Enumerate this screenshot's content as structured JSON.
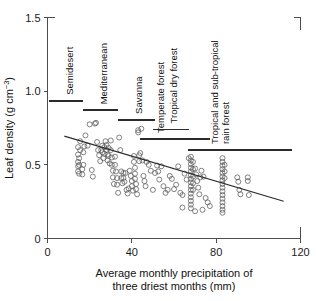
{
  "chart_data": {
    "type": "scatter",
    "title": "",
    "xlabel": "Average monthly precipitation of three driest months (mm)",
    "xlabel_line1": "Average monthly precipitation of",
    "xlabel_line2": "three driest months (mm)",
    "ylabel": "Leaf density (g cm-3)",
    "ylabel_main": "Leaf density (g cm",
    "ylabel_sup": "−3",
    "ylabel_close": ")",
    "xlim": [
      0,
      120
    ],
    "ylim": [
      0,
      1.5
    ],
    "xticks": [
      0,
      40,
      80,
      120
    ],
    "xticklabels": [
      "0",
      "40",
      "80",
      "120"
    ],
    "yticks": [
      0,
      0.5,
      1.0,
      1.5
    ],
    "yticklabels": [
      "0",
      "0.5",
      "1.0",
      "1.5"
    ],
    "grid": false,
    "legend": "none",
    "marker": "open-circle",
    "trendline": {
      "label": "regression line",
      "x_start": 8,
      "y_start": 0.695,
      "x_end": 112,
      "y_end": 0.253
    },
    "habitat_ranges": [
      {
        "label": "Semidesert",
        "x_start": 0.5,
        "y": 0.935,
        "x_end": 17.0
      },
      {
        "label": "Mediterranean",
        "x_start": 17.0,
        "y": 0.87,
        "x_end": 33.5
      },
      {
        "label": "Savanna",
        "x_start": 33.5,
        "y": 0.805,
        "x_end": 51.0
      },
      {
        "label": "Tropical dry forest",
        "x_start": 50.0,
        "y": 0.74,
        "x_end": 67.0
      },
      {
        "label": "Temperate forest",
        "x_start": 44.0,
        "y": 0.675,
        "x_end": 77.0
      },
      {
        "label": "Tropical and sub-tropical rain forest",
        "x_start": 66.5,
        "y": 0.6,
        "x_end": 116.0
      }
    ],
    "points": [
      [
        14.5,
        0.62
      ],
      [
        14.5,
        0.57
      ],
      [
        14.5,
        0.52
      ],
      [
        14.5,
        0.49
      ],
      [
        14.5,
        0.455
      ],
      [
        15.5,
        0.66
      ],
      [
        15.5,
        0.6
      ],
      [
        15.0,
        0.545
      ],
      [
        15.0,
        0.5
      ],
      [
        15.0,
        0.44
      ],
      [
        16.5,
        0.47
      ],
      [
        16.5,
        0.435
      ],
      [
        17.0,
        0.585
      ],
      [
        17.5,
        0.625
      ],
      [
        17.0,
        0.5
      ],
      [
        18.0,
        0.7
      ],
      [
        19.0,
        0.63
      ],
      [
        20.0,
        0.775
      ],
      [
        21.0,
        0.465
      ],
      [
        21.5,
        0.42
      ],
      [
        22.5,
        0.78
      ],
      [
        23.0,
        0.785
      ],
      [
        23.5,
        0.655
      ],
      [
        24.0,
        0.6
      ],
      [
        24.5,
        0.565
      ],
      [
        25.0,
        0.525
      ],
      [
        25.5,
        0.6
      ],
      [
        26.0,
        0.63
      ],
      [
        26.0,
        0.585
      ],
      [
        26.5,
        0.545
      ],
      [
        27.0,
        0.62
      ],
      [
        27.0,
        0.575
      ],
      [
        27.5,
        0.66
      ],
      [
        28.0,
        0.635
      ],
      [
        28.0,
        0.6
      ],
      [
        28.5,
        0.57
      ],
      [
        28.5,
        0.53
      ],
      [
        29.0,
        0.615
      ],
      [
        29.0,
        0.56
      ],
      [
        29.5,
        0.51
      ],
      [
        30.0,
        0.665
      ],
      [
        30.0,
        0.6
      ],
      [
        30.5,
        0.55
      ],
      [
        30.5,
        0.5
      ],
      [
        31.0,
        0.46
      ],
      [
        31.0,
        0.415
      ],
      [
        31.5,
        0.37
      ],
      [
        32.0,
        0.555
      ],
      [
        32.0,
        0.5
      ],
      [
        32.5,
        0.455
      ],
      [
        33.0,
        0.41
      ],
      [
        33.0,
        0.365
      ],
      [
        33.5,
        0.31
      ],
      [
        34.0,
        0.685
      ],
      [
        34.5,
        0.6
      ],
      [
        35.0,
        0.455
      ],
      [
        35.0,
        0.41
      ],
      [
        35.5,
        0.375
      ],
      [
        36.0,
        0.445
      ],
      [
        36.0,
        0.41
      ],
      [
        36.5,
        0.385
      ],
      [
        37.0,
        0.445
      ],
      [
        37.5,
        0.33
      ],
      [
        38.0,
        0.305
      ],
      [
        38.5,
        0.34
      ],
      [
        39.0,
        0.46
      ],
      [
        39.5,
        0.425
      ],
      [
        40.0,
        0.39
      ],
      [
        40.0,
        0.355
      ],
      [
        40.5,
        0.325
      ],
      [
        41.0,
        0.56
      ],
      [
        41.0,
        0.52
      ],
      [
        41.5,
        0.48
      ],
      [
        41.5,
        0.44
      ],
      [
        41.5,
        0.405
      ],
      [
        42.0,
        0.37
      ],
      [
        42.0,
        0.335
      ],
      [
        42.5,
        0.3
      ],
      [
        43.0,
        0.735
      ],
      [
        43.0,
        0.72
      ],
      [
        43.5,
        0.565
      ],
      [
        43.5,
        0.525
      ],
      [
        44.0,
        0.58
      ],
      [
        44.5,
        0.745
      ],
      [
        45.0,
        0.53
      ],
      [
        45.5,
        0.425
      ],
      [
        46.0,
        0.39
      ],
      [
        46.5,
        0.355
      ],
      [
        47.0,
        0.52
      ],
      [
        48.0,
        0.5
      ],
      [
        49.0,
        0.46
      ],
      [
        50.0,
        0.33
      ],
      [
        51.0,
        0.445
      ],
      [
        52.0,
        0.495
      ],
      [
        52.5,
        0.455
      ],
      [
        53.0,
        0.4
      ],
      [
        54.0,
        0.49
      ],
      [
        55.0,
        0.355
      ],
      [
        56.0,
        0.31
      ],
      [
        57.0,
        0.33
      ],
      [
        58.0,
        0.425
      ],
      [
        59.0,
        0.405
      ],
      [
        60.0,
        0.335
      ],
      [
        61.0,
        0.365
      ],
      [
        62.0,
        0.49
      ],
      [
        63.0,
        0.31
      ],
      [
        64.0,
        0.295
      ],
      [
        65.0,
        0.44
      ],
      [
        66.0,
        0.4
      ],
      [
        67.0,
        0.545
      ],
      [
        68.0,
        0.555
      ],
      [
        68.0,
        0.53
      ],
      [
        68.0,
        0.505
      ],
      [
        68.0,
        0.48
      ],
      [
        68.0,
        0.455
      ],
      [
        68.0,
        0.43
      ],
      [
        68.0,
        0.405
      ],
      [
        68.0,
        0.38
      ],
      [
        68.0,
        0.355
      ],
      [
        68.0,
        0.33
      ],
      [
        68.0,
        0.305
      ],
      [
        68.0,
        0.28
      ],
      [
        68.0,
        0.255
      ],
      [
        68.0,
        0.23
      ],
      [
        68.0,
        0.205
      ],
      [
        69.0,
        0.52
      ],
      [
        69.0,
        0.47
      ],
      [
        69.0,
        0.42
      ],
      [
        69.0,
        0.375
      ],
      [
        69.0,
        0.33
      ],
      [
        70.0,
        0.475
      ],
      [
        70.5,
        0.435
      ],
      [
        71.0,
        0.39
      ],
      [
        71.5,
        0.345
      ],
      [
        72.0,
        0.3
      ],
      [
        72.5,
        0.415
      ],
      [
        73.0,
        0.46
      ],
      [
        74.0,
        0.42
      ],
      [
        75.0,
        0.275
      ],
      [
        76.0,
        0.245
      ],
      [
        77.0,
        0.22
      ],
      [
        64.0,
        0.21
      ],
      [
        70.0,
        0.185
      ],
      [
        73.5,
        0.195
      ],
      [
        83.0,
        0.545
      ],
      [
        83.0,
        0.52
      ],
      [
        83.0,
        0.495
      ],
      [
        83.0,
        0.47
      ],
      [
        83.0,
        0.445
      ],
      [
        83.0,
        0.42
      ],
      [
        83.0,
        0.395
      ],
      [
        83.0,
        0.37
      ],
      [
        83.0,
        0.345
      ],
      [
        83.0,
        0.32
      ],
      [
        83.0,
        0.295
      ],
      [
        83.0,
        0.27
      ],
      [
        83.0,
        0.245
      ],
      [
        83.0,
        0.22
      ],
      [
        83.0,
        0.195
      ],
      [
        83.0,
        0.175
      ],
      [
        84.0,
        0.5
      ],
      [
        84.0,
        0.455
      ],
      [
        84.0,
        0.41
      ],
      [
        90.0,
        0.415
      ],
      [
        90.5,
        0.385
      ],
      [
        91.0,
        0.33
      ],
      [
        91.5,
        0.3
      ],
      [
        95.0,
        0.415
      ],
      [
        95.0,
        0.39
      ],
      [
        95.5,
        0.295
      ]
    ]
  }
}
